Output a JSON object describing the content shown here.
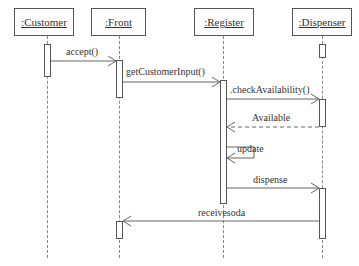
{
  "diagram": {
    "type": "uml-sequence",
    "objects": [
      {
        "id": "customer",
        "label": ":Customer"
      },
      {
        "id": "front",
        "label": ":Front"
      },
      {
        "id": "register",
        "label": ":Register"
      },
      {
        "id": "dispenser",
        "label": ":Dispenser"
      }
    ],
    "messages": [
      {
        "from": "customer",
        "to": "front",
        "label": "accept()",
        "style": "sync"
      },
      {
        "from": "front",
        "to": "register",
        "label": "getCustomerInput()",
        "style": "sync"
      },
      {
        "from": "register",
        "to": "dispenser",
        "label": ".checkAvailability()",
        "style": "sync"
      },
      {
        "from": "dispenser",
        "to": "register",
        "label": "Available",
        "style": "return"
      },
      {
        "from": "register",
        "to": "register",
        "label": "update",
        "style": "self"
      },
      {
        "from": "register",
        "to": "dispenser",
        "label": "dispense",
        "style": "sync"
      },
      {
        "from": "dispenser",
        "to": "front",
        "label": "receivesoda",
        "style": "sync"
      }
    ]
  }
}
